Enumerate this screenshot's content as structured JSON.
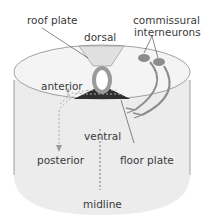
{
  "diagram": {
    "labels": {
      "roof_plate": "roof plate",
      "dorsal": "dorsal",
      "commissural_line1": "commissural",
      "commissural_line2": "interneurons",
      "anterior": "anterior",
      "ventral": "ventral",
      "posterior": "posterior",
      "floor_plate": "floor plate",
      "midline": "midline"
    },
    "colors": {
      "cylinder_fill": "#ececec",
      "cylinder_top": "#f2f2f2",
      "outline": "#8a8a8a",
      "roof_plate_fill": "#e0e0e0",
      "floor_plate_fill": "#2f2f2f",
      "tube_ring": "#9a9a9a",
      "neuron": "#8c8c8c",
      "text": "#3a3a3a"
    }
  }
}
